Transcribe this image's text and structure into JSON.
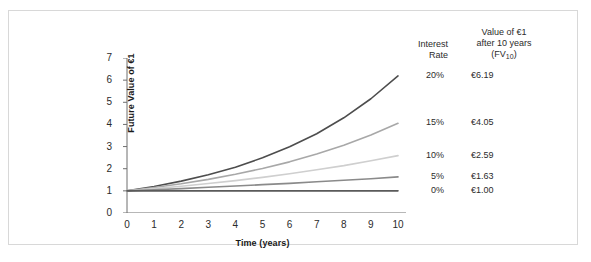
{
  "chart_data": {
    "type": "line",
    "title": "",
    "xlabel": "Time (years)",
    "ylabel": "Future Value of €1",
    "xlim": [
      0,
      10
    ],
    "ylim": [
      0,
      7
    ],
    "grid": false,
    "legend_position": "right-of-plot",
    "x": [
      0,
      1,
      2,
      3,
      4,
      5,
      6,
      7,
      8,
      9,
      10
    ],
    "x_tick_labels": [
      "0",
      "1",
      "2",
      "3",
      "4",
      "5",
      "6",
      "7",
      "8",
      "9",
      "10"
    ],
    "y_tick_labels": [
      "0",
      "1",
      "2",
      "3",
      "4",
      "5",
      "6",
      "7"
    ],
    "series": [
      {
        "name": "20%",
        "rate": 0.2,
        "color": "#4d4d4d",
        "values": [
          1.0,
          1.2,
          1.44,
          1.73,
          2.07,
          2.49,
          2.99,
          3.58,
          4.3,
          5.16,
          6.19
        ]
      },
      {
        "name": "15%",
        "rate": 0.15,
        "color": "#a8a8a8",
        "values": [
          1.0,
          1.15,
          1.32,
          1.52,
          1.75,
          2.01,
          2.31,
          2.66,
          3.06,
          3.52,
          4.05
        ]
      },
      {
        "name": "10%",
        "rate": 0.1,
        "color": "#cfcfcf",
        "values": [
          1.0,
          1.1,
          1.21,
          1.33,
          1.46,
          1.61,
          1.77,
          1.95,
          2.14,
          2.36,
          2.59
        ]
      },
      {
        "name": "5%",
        "rate": 0.05,
        "color": "#8a8a8a",
        "values": [
          1.0,
          1.05,
          1.1,
          1.16,
          1.22,
          1.28,
          1.34,
          1.41,
          1.48,
          1.55,
          1.63
        ]
      },
      {
        "name": "0%",
        "rate": 0.0,
        "color": "#5a5a5a",
        "values": [
          1.0,
          1.0,
          1.0,
          1.0,
          1.0,
          1.0,
          1.0,
          1.0,
          1.0,
          1.0,
          1.0
        ]
      }
    ],
    "annotations": {
      "rate_labels": [
        "20%",
        "15%",
        "10%",
        "5%",
        "0%"
      ],
      "final_values": [
        "€6.19",
        "€4.05",
        "€2.59",
        "€1.63",
        "€1.00"
      ]
    }
  },
  "legend": {
    "header_rate_line1": "Interest",
    "header_rate_line2": "Rate",
    "header_value_line1": "Value of €1",
    "header_value_line2": "after 10 years",
    "header_value_line3_prefix": "(FV",
    "header_value_line3_sub": "10",
    "header_value_line3_suffix": ")"
  }
}
